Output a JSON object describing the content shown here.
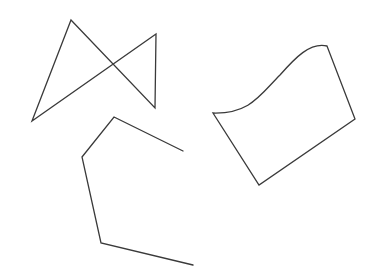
{
  "canvas": {
    "width": 366,
    "height": 276,
    "background": "#ffffff"
  },
  "style": {
    "stroke": "#3a3a3a",
    "stroke_width": 1.3
  },
  "shapes": [
    {
      "id": "bowtie",
      "type": "closed-polygon",
      "points": "71,20 155,108 156,34 32,121"
    },
    {
      "id": "open-polyline",
      "type": "open-polyline",
      "points": "183,151 114,117 82,157 101,243 193,265"
    },
    {
      "id": "wavy-quad",
      "type": "closed-path",
      "d": "M213,113 C250,114 260,95 280,75 C295,58 310,42 327,46 L355,119 L259,185 Z"
    }
  ]
}
